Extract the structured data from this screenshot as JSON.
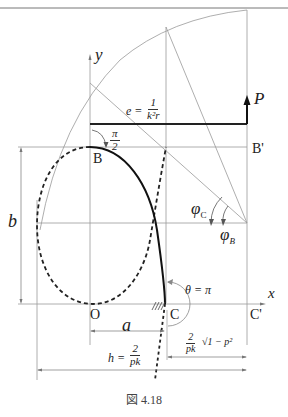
{
  "header": {
    "text": "第４章　梁理論を進める"
  },
  "labels": {
    "y_axis": "y",
    "x_axis": "x",
    "P": "P",
    "B": "B",
    "B_prime": "B'",
    "O": "O",
    "C": "C",
    "C_prime": "C'",
    "b": "b",
    "a": "a",
    "phi_C": "φ",
    "phi_C_sub": "C",
    "phi_B": "φ",
    "phi_B_sub": "B",
    "theta": "θ = π",
    "half_pi_num": "π",
    "half_pi_den": "2",
    "e_lhs": "e =",
    "e_num": "1",
    "e_den": "k²r",
    "h_lhs": "h =",
    "h_num": "2",
    "h_den": "pk",
    "cc_num": "2",
    "cc_den": "pk",
    "cc_sqrt": "√1 − p²"
  },
  "caption": "図 4.18"
}
